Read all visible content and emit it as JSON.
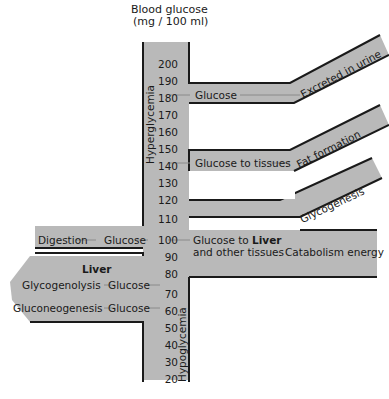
{
  "title": {
    "line1": "Blood glucose",
    "line2": "(mg / 100 ml)"
  },
  "colors": {
    "fill": "#b9b9b9",
    "stroke": "#1a1a1a",
    "arrow": "#8a8a8a"
  },
  "axis": {
    "ticks": [
      "200",
      "190",
      "180",
      "170",
      "160",
      "150",
      "140",
      "130",
      "120",
      "110",
      "100",
      "90",
      "80",
      "70",
      "60",
      "50",
      "40",
      "30",
      "20"
    ],
    "upper_label": "Hyperglycemia",
    "lower_label": "Hypoglycemia"
  },
  "branches": {
    "excreted": {
      "inflow": "Glucose",
      "outflow": "Excreted in urine"
    },
    "fat": {
      "inflow": "Glucose to tissues",
      "outflow": "Fat formation"
    },
    "glycogenesis": {
      "outflow": "Glycogenesis"
    },
    "liver_out": {
      "line1_prefix": "Glucose to ",
      "line1_bold": "Liver",
      "line2": "and other tissues",
      "outflow": "Catabolism energy"
    }
  },
  "inputs": {
    "digestion": {
      "source": "Digestion",
      "product": "Glucose"
    },
    "liver": {
      "title": "Liver",
      "rows": [
        {
          "source": "Glycogenolysis",
          "product": "Glucose"
        },
        {
          "source": "Gluconeogenesis",
          "product": "Glucose"
        }
      ]
    }
  }
}
